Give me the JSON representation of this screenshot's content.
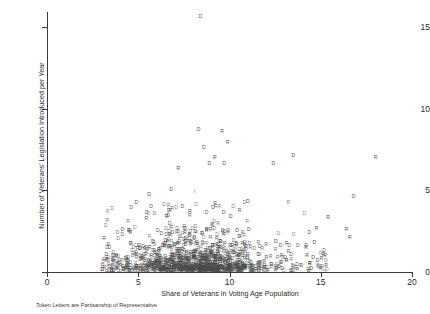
{
  "chart_data": {
    "type": "scatter",
    "title": "",
    "subtitle": "",
    "xlabel": "Share of Veterans in Voting Age Population",
    "ylabel": "Number of Veterans' Legislation Introduced per Year",
    "footnote": "Token Letters are Partisanship of Representative",
    "grid": false,
    "legend": "none",
    "marker_style": "text-token",
    "xlim": [
      0,
      20
    ],
    "ylim": [
      0,
      16
    ],
    "xticks": [
      0,
      5,
      10,
      15,
      20
    ],
    "xtick_labels": [
      "0",
      "5",
      "10",
      "15",
      "20"
    ],
    "yticks": [
      0,
      5,
      10,
      15
    ],
    "ytick_labels": [
      "0",
      "5",
      "10",
      "15"
    ],
    "marker_color": "#4a4a4a",
    "axis_color": "#3a3a3a",
    "background": "#ffffff",
    "series": [
      {
        "name": "D",
        "label": "D",
        "description": "Democratic representatives"
      },
      {
        "name": "R",
        "label": "R",
        "description": "Republican representatives"
      }
    ],
    "notable_points": [
      {
        "x": 8.4,
        "y": 15.6,
        "label": "D"
      },
      {
        "x": 8.3,
        "y": 8.7,
        "label": "D"
      },
      {
        "x": 9.6,
        "y": 8.6,
        "label": "R"
      },
      {
        "x": 8.6,
        "y": 7.6,
        "label": "D"
      },
      {
        "x": 9.9,
        "y": 7.9,
        "label": "R"
      },
      {
        "x": 9.2,
        "y": 7.0,
        "label": "R"
      },
      {
        "x": 8.9,
        "y": 6.6,
        "label": "D"
      },
      {
        "x": 9.7,
        "y": 6.6,
        "label": "D"
      },
      {
        "x": 12.4,
        "y": 6.6,
        "label": "D"
      },
      {
        "x": 13.5,
        "y": 7.1,
        "label": "D"
      },
      {
        "x": 18.0,
        "y": 7.0,
        "label": "R"
      },
      {
        "x": 7.2,
        "y": 6.3,
        "label": "R"
      },
      {
        "x": 6.8,
        "y": 5.0,
        "label": "D"
      },
      {
        "x": 8.1,
        "y": 4.9,
        "label": "I"
      },
      {
        "x": 5.6,
        "y": 4.7,
        "label": "D"
      },
      {
        "x": 16.8,
        "y": 4.6,
        "label": "D"
      },
      {
        "x": 11.0,
        "y": 4.3,
        "label": "D"
      },
      {
        "x": 4.9,
        "y": 4.2,
        "label": "D"
      },
      {
        "x": 9.1,
        "y": 3.9,
        "label": "D"
      },
      {
        "x": 15.4,
        "y": 3.3,
        "label": "R"
      },
      {
        "x": 16.4,
        "y": 2.6,
        "label": "R"
      },
      {
        "x": 16.6,
        "y": 2.1,
        "label": "R"
      }
    ],
    "cloud": {
      "description": "Dense overlapping D/R letter tokens concentrated between share 1 and 15 with counts mostly 0 to 2.5",
      "n_points": 1180,
      "x_range": [
        0.6,
        15.6
      ],
      "y_range": [
        0.0,
        3.2
      ],
      "peak_density_x": [
        7.5,
        11.5
      ],
      "party_ratio_D": 0.55
    }
  },
  "axis": {
    "y_title": "Number of Veterans' Legislation Introduced per Year",
    "x_title": "Share of Veterans in Voting Age Population"
  },
  "footnote": {
    "text": "Token Letters are Partisanship of Representative"
  }
}
